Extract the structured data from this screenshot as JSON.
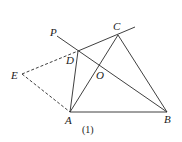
{
  "figure": {
    "caption": "(1)",
    "points": {
      "P": {
        "label": "P",
        "x": 57,
        "y": 36,
        "lx": 50,
        "ly": 36
      },
      "C": {
        "label": "C",
        "x": 118,
        "y": 35,
        "lx": 113,
        "ly": 30
      },
      "D": {
        "label": "D",
        "x": 78,
        "y": 51,
        "lx": 66,
        "ly": 64
      },
      "E": {
        "label": "E",
        "x": 22,
        "y": 74,
        "lx": 11,
        "ly": 79
      },
      "O": {
        "label": "O",
        "x": 96,
        "y": 66,
        "lx": 96,
        "ly": 79
      },
      "A": {
        "label": "A",
        "x": 70,
        "y": 112,
        "lx": 65,
        "ly": 124
      },
      "B": {
        "label": "B",
        "x": 167,
        "y": 112,
        "lx": 164,
        "ly": 123
      }
    },
    "segments_solid": [
      [
        "P-B",
        57,
        36,
        167,
        112
      ],
      [
        "D-ext",
        78,
        51,
        135,
        27
      ],
      [
        "A-D",
        70,
        112,
        78,
        51
      ],
      [
        "A-C",
        70,
        112,
        118,
        35
      ],
      [
        "C-B",
        118,
        35,
        167,
        112
      ],
      [
        "A-B",
        70,
        112,
        167,
        112
      ]
    ],
    "segments_dashed": [
      [
        "E-D",
        22,
        74,
        78,
        51
      ],
      [
        "E-A",
        22,
        74,
        70,
        112
      ]
    ]
  }
}
